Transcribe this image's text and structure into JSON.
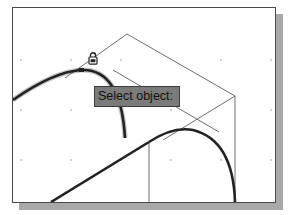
{
  "viewport": {
    "background": "#ffffff",
    "border_color": "#4a4a4a",
    "shadow_color": "#a9a9a9"
  },
  "tooltip": {
    "prompt": "Select object:",
    "background": "#7b7b7b",
    "text_color": "#111111"
  },
  "cursor": {
    "icon": "lock-icon"
  },
  "grid": {
    "spacing_px": 50,
    "dot_color": "#9a9a9a"
  },
  "geometry": {
    "thin_line_color": "#6e6e6e",
    "thick_line_color": "#222222"
  }
}
